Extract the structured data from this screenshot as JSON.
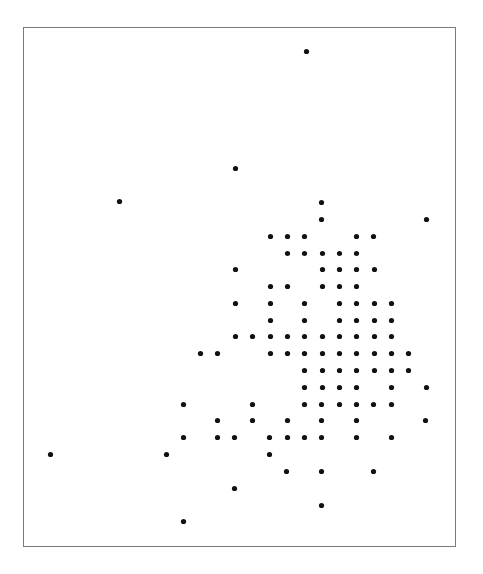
{
  "chart_data": {
    "type": "scatter",
    "title": "",
    "xlabel": "",
    "ylabel": "",
    "axes_visible": false,
    "grid": false,
    "legend": null,
    "coordinate_system": "pixel coordinates within the plot frame (frame origin top-left at 24,27; size 431x518)",
    "marker": {
      "shape": "circle",
      "radius": 2.6,
      "color": "#111111"
    },
    "frame": {
      "border_color": "#7a7a7a"
    },
    "points": [
      {
        "x": 307,
        "y": 52
      },
      {
        "x": 236,
        "y": 169
      },
      {
        "x": 120,
        "y": 202
      },
      {
        "x": 322,
        "y": 203
      },
      {
        "x": 322,
        "y": 220
      },
      {
        "x": 427,
        "y": 220
      },
      {
        "x": 271,
        "y": 237
      },
      {
        "x": 288,
        "y": 237
      },
      {
        "x": 305,
        "y": 237
      },
      {
        "x": 357,
        "y": 237
      },
      {
        "x": 374,
        "y": 237
      },
      {
        "x": 288,
        "y": 254
      },
      {
        "x": 305,
        "y": 254
      },
      {
        "x": 323,
        "y": 254
      },
      {
        "x": 340,
        "y": 254
      },
      {
        "x": 357,
        "y": 254
      },
      {
        "x": 236,
        "y": 270
      },
      {
        "x": 323,
        "y": 270
      },
      {
        "x": 340,
        "y": 270
      },
      {
        "x": 357,
        "y": 270
      },
      {
        "x": 375,
        "y": 270
      },
      {
        "x": 271,
        "y": 287
      },
      {
        "x": 288,
        "y": 287
      },
      {
        "x": 323,
        "y": 287
      },
      {
        "x": 340,
        "y": 287
      },
      {
        "x": 357,
        "y": 287
      },
      {
        "x": 236,
        "y": 304
      },
      {
        "x": 271,
        "y": 304
      },
      {
        "x": 305,
        "y": 304
      },
      {
        "x": 340,
        "y": 304
      },
      {
        "x": 357,
        "y": 304
      },
      {
        "x": 375,
        "y": 304
      },
      {
        "x": 392,
        "y": 304
      },
      {
        "x": 271,
        "y": 321
      },
      {
        "x": 305,
        "y": 321
      },
      {
        "x": 340,
        "y": 321
      },
      {
        "x": 357,
        "y": 321
      },
      {
        "x": 375,
        "y": 321
      },
      {
        "x": 392,
        "y": 321
      },
      {
        "x": 236,
        "y": 337
      },
      {
        "x": 253,
        "y": 337
      },
      {
        "x": 271,
        "y": 337
      },
      {
        "x": 288,
        "y": 337
      },
      {
        "x": 305,
        "y": 337
      },
      {
        "x": 323,
        "y": 337
      },
      {
        "x": 340,
        "y": 337
      },
      {
        "x": 357,
        "y": 337
      },
      {
        "x": 375,
        "y": 337
      },
      {
        "x": 392,
        "y": 337
      },
      {
        "x": 201,
        "y": 354
      },
      {
        "x": 218,
        "y": 354
      },
      {
        "x": 271,
        "y": 354
      },
      {
        "x": 288,
        "y": 354
      },
      {
        "x": 305,
        "y": 354
      },
      {
        "x": 323,
        "y": 354
      },
      {
        "x": 340,
        "y": 354
      },
      {
        "x": 357,
        "y": 354
      },
      {
        "x": 375,
        "y": 354
      },
      {
        "x": 392,
        "y": 354
      },
      {
        "x": 409,
        "y": 354
      },
      {
        "x": 305,
        "y": 371
      },
      {
        "x": 323,
        "y": 371
      },
      {
        "x": 340,
        "y": 371
      },
      {
        "x": 357,
        "y": 371
      },
      {
        "x": 375,
        "y": 371
      },
      {
        "x": 392,
        "y": 371
      },
      {
        "x": 409,
        "y": 371
      },
      {
        "x": 305,
        "y": 388
      },
      {
        "x": 323,
        "y": 388
      },
      {
        "x": 340,
        "y": 388
      },
      {
        "x": 357,
        "y": 388
      },
      {
        "x": 392,
        "y": 388
      },
      {
        "x": 427,
        "y": 388
      },
      {
        "x": 184,
        "y": 405
      },
      {
        "x": 253,
        "y": 405
      },
      {
        "x": 305,
        "y": 405
      },
      {
        "x": 322,
        "y": 405
      },
      {
        "x": 340,
        "y": 405
      },
      {
        "x": 357,
        "y": 405
      },
      {
        "x": 374,
        "y": 405
      },
      {
        "x": 392,
        "y": 405
      },
      {
        "x": 218,
        "y": 421
      },
      {
        "x": 253,
        "y": 421
      },
      {
        "x": 288,
        "y": 421
      },
      {
        "x": 322,
        "y": 421
      },
      {
        "x": 357,
        "y": 421
      },
      {
        "x": 426,
        "y": 421
      },
      {
        "x": 184,
        "y": 438
      },
      {
        "x": 218,
        "y": 438
      },
      {
        "x": 235,
        "y": 438
      },
      {
        "x": 270,
        "y": 438
      },
      {
        "x": 288,
        "y": 438
      },
      {
        "x": 305,
        "y": 438
      },
      {
        "x": 322,
        "y": 438
      },
      {
        "x": 357,
        "y": 438
      },
      {
        "x": 392,
        "y": 438
      },
      {
        "x": 51,
        "y": 455
      },
      {
        "x": 167,
        "y": 455
      },
      {
        "x": 270,
        "y": 455
      },
      {
        "x": 287,
        "y": 472
      },
      {
        "x": 322,
        "y": 472
      },
      {
        "x": 374,
        "y": 472
      },
      {
        "x": 235,
        "y": 489
      },
      {
        "x": 322,
        "y": 506
      },
      {
        "x": 184,
        "y": 522
      }
    ],
    "point_count": 104
  }
}
